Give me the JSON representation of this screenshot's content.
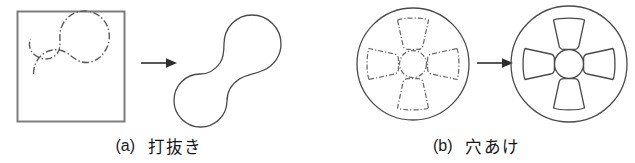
{
  "figure": {
    "background_color": "#ffffff",
    "line_color": "#4a4a4a",
    "frame_color": "#7d7d7d",
    "text_color": "#1a1a1a",
    "panels": [
      {
        "id": "a",
        "index_label": "(a)",
        "caption_label": "打抜き",
        "before": {
          "name": "sheet-blank-with-dashdot-outline",
          "container_shape": "square",
          "outline_shape": "peanut",
          "line_style": "dash-dot"
        },
        "arrow": {
          "name": "process-arrow",
          "direction": "right"
        },
        "after": {
          "name": "blanked-peanut-part",
          "outline_shape": "peanut",
          "line_style": "solid"
        }
      },
      {
        "id": "b",
        "index_label": "(b)",
        "caption_label": "穴あけ",
        "before": {
          "name": "disc-with-dashdot-holes",
          "container_shape": "circle",
          "hole_count": 4,
          "center_hole": true,
          "line_style": "dash-dot"
        },
        "arrow": {
          "name": "process-arrow",
          "direction": "right"
        },
        "after": {
          "name": "pierced-wheel-part",
          "container_shape": "circle",
          "hole_count": 4,
          "center_hole": true,
          "line_style": "solid"
        }
      }
    ]
  }
}
